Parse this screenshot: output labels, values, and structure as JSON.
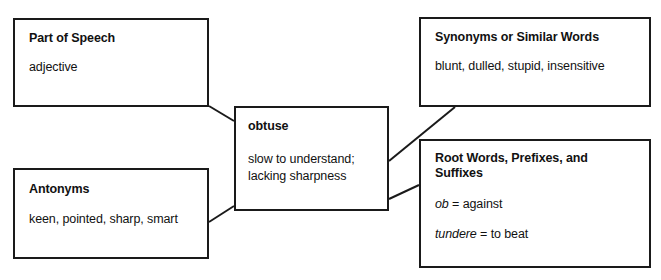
{
  "diagram": {
    "type": "word-map",
    "line_color": "#1a1a1a",
    "background_color": "#ffffff",
    "nodes": {
      "part_of_speech": {
        "title": "Part of Speech",
        "body": "adjective"
      },
      "synonyms": {
        "title": "Synonyms or Similar Words",
        "body": "blunt, dulled, stupid, insensitive"
      },
      "term": {
        "title": "obtuse",
        "body_line1": "slow to understand;",
        "body_line2": "lacking sharpness"
      },
      "antonyms": {
        "title": "Antonyms",
        "body": "keen, pointed, sharp, smart"
      },
      "roots": {
        "title": "Root Words, Prefixes, and Suffixes",
        "entries": [
          {
            "term": "ob",
            "equals": "= against"
          },
          {
            "term": "tundere",
            "equals": "= to beat"
          }
        ]
      }
    }
  }
}
